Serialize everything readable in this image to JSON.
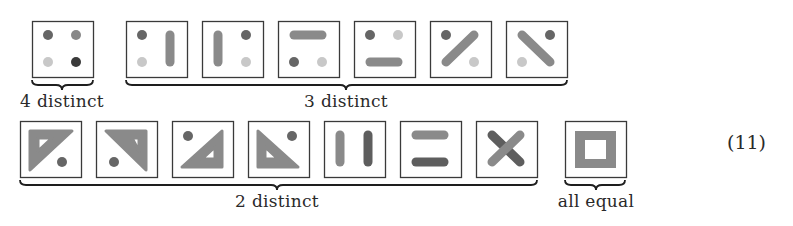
{
  "equation_number": "(11)",
  "colors": {
    "frame": "#3a3a3a",
    "brace": "#1e1e1e",
    "dark": "#3a3a3a",
    "mid_dark": "#666666",
    "mid": "#888888",
    "light": "#c8c8c8",
    "bar": "#8a8a8a",
    "bar_dark": "#5e5e5e"
  },
  "groups": [
    {
      "label": "4 distinct",
      "row": 1,
      "brace_x1": 32,
      "brace_x2": 93,
      "label_x": 62,
      "label_y": 93
    },
    {
      "label": "3 distinct",
      "row": 1,
      "brace_x1": 126,
      "brace_x2": 567,
      "label_x": 346,
      "label_y": 93
    },
    {
      "label": "2 distinct",
      "row": 2,
      "brace_x1": 20,
      "brace_x2": 537,
      "label_x": 277,
      "label_y": 193
    },
    {
      "label": "all equal",
      "row": 2,
      "brace_x1": 565,
      "brace_x2": 625,
      "label_x": 596,
      "label_y": 193
    }
  ],
  "tiles": [
    {
      "id": "r1-t1",
      "x": 32,
      "y": 21,
      "kind": "four-dots",
      "desc": "four dots of different shades"
    },
    {
      "id": "r1-t2",
      "x": 126,
      "y": 21,
      "kind": "dots-left-bar-right",
      "desc": "two dots on left, vertical bar on right"
    },
    {
      "id": "r1-t3",
      "x": 202,
      "y": 21,
      "kind": "bar-left-dots-right",
      "desc": "vertical bar on left, two dots on right"
    },
    {
      "id": "r1-t4",
      "x": 278,
      "y": 21,
      "kind": "bar-top-dots-bottom",
      "desc": "horizontal bar on top, two dots on bottom"
    },
    {
      "id": "r1-t5",
      "x": 354,
      "y": 21,
      "kind": "dots-top-bar-bottom",
      "desc": "two dots on top, horizontal bar on bottom"
    },
    {
      "id": "r1-t6",
      "x": 430,
      "y": 21,
      "kind": "diag-up",
      "desc": "diagonal bar bottom-left to top-right with two dots"
    },
    {
      "id": "r1-t7",
      "x": 506,
      "y": 21,
      "kind": "diag-down",
      "desc": "diagonal bar top-left to bottom-right with two dots"
    },
    {
      "id": "r2-t1",
      "x": 20,
      "y": 121,
      "kind": "tri-tl",
      "desc": "hollow triangle top-left with dot"
    },
    {
      "id": "r2-t2",
      "x": 96,
      "y": 121,
      "kind": "tri-tr",
      "desc": "hollow triangle top-right with dot"
    },
    {
      "id": "r2-t3",
      "x": 172,
      "y": 121,
      "kind": "tri-br",
      "desc": "hollow triangle bottom-right with dot"
    },
    {
      "id": "r2-t4",
      "x": 248,
      "y": 121,
      "kind": "tri-bl",
      "desc": "hollow triangle bottom-left with dot"
    },
    {
      "id": "r2-t5",
      "x": 324,
      "y": 121,
      "kind": "two-vbars",
      "desc": "two vertical bars"
    },
    {
      "id": "r2-t6",
      "x": 400,
      "y": 121,
      "kind": "two-hbars",
      "desc": "two horizontal bars"
    },
    {
      "id": "r2-t7",
      "x": 476,
      "y": 121,
      "kind": "cross",
      "desc": "two crossing diagonal bars"
    },
    {
      "id": "r2-t8",
      "x": 565,
      "y": 121,
      "kind": "square-ring",
      "desc": "hollow square"
    }
  ]
}
